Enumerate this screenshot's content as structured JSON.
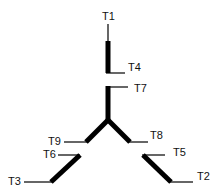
{
  "diagram": {
    "type": "tree",
    "labels": {
      "t1": "T1",
      "t2": "T2",
      "t3": "T3",
      "t4": "T4",
      "t5": "T5",
      "t6": "T6",
      "t7": "T7",
      "t8": "T8",
      "t9": "T9"
    },
    "colors": {
      "line": "#000000",
      "background": "#ffffff"
    }
  }
}
